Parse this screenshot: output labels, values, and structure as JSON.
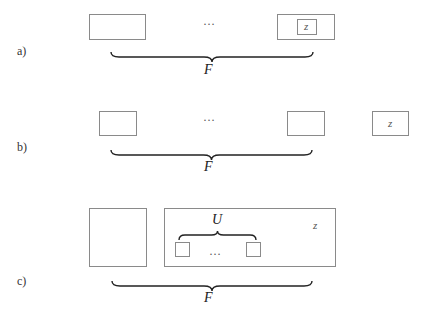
{
  "panels": {
    "a": {
      "label": "a)",
      "ellipsis": "…",
      "inner_box_label": "z",
      "brace_label": "F"
    },
    "b": {
      "label": "b)",
      "ellipsis": "…",
      "z_box_label": "z",
      "brace_label": "F"
    },
    "c": {
      "label": "c)",
      "inner_brace_label": "U",
      "ellipsis": "…",
      "z_label": "z",
      "brace_label": "F"
    }
  },
  "colors": {
    "box_border": "#8a8a8a",
    "brace": "#222222",
    "background": "#ffffff"
  }
}
